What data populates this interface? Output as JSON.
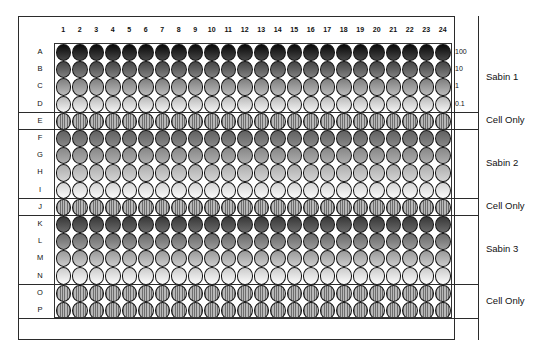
{
  "figure": {
    "caption": "",
    "column_headers": [
      "1",
      "2",
      "3",
      "4",
      "5",
      "6",
      "7",
      "8",
      "9",
      "10",
      "11",
      "12",
      "13",
      "14",
      "15",
      "16",
      "17",
      "18",
      "19",
      "20",
      "21",
      "22",
      "23",
      "24"
    ],
    "row_labels": [
      "A",
      "B",
      "C",
      "D",
      "E",
      "F",
      "G",
      "H",
      "I",
      "J",
      "K",
      "L",
      "M",
      "N",
      "O",
      "P"
    ],
    "concentration_labels": [
      "100",
      "10",
      "1",
      "0.1"
    ],
    "group_labels": [
      {
        "name": "sabin-1",
        "text": "Sabin 1"
      },
      {
        "name": "cell-only-1",
        "text": "Cell Only"
      },
      {
        "name": "sabin-2",
        "text": "Sabin 2"
      },
      {
        "name": "cell-only-2",
        "text": "Cell Only"
      },
      {
        "name": "sabin-3",
        "text": "Sabin 3"
      },
      {
        "name": "cell-only-3",
        "text": "Cell Only"
      }
    ]
  },
  "chart_data": {
    "type": "heatmap",
    "xlabel": "Column",
    "ylabel": "Row",
    "columns": 24,
    "rows": 16,
    "x": [
      "1",
      "2",
      "3",
      "4",
      "5",
      "6",
      "7",
      "8",
      "9",
      "10",
      "11",
      "12",
      "13",
      "14",
      "15",
      "16",
      "17",
      "18",
      "19",
      "20",
      "21",
      "22",
      "23",
      "24"
    ],
    "y": [
      "A",
      "B",
      "C",
      "D",
      "E",
      "F",
      "G",
      "H",
      "I",
      "J",
      "K",
      "L",
      "M",
      "N",
      "O",
      "P"
    ],
    "colormap": "grayscale",
    "value_scale": "0 = black (highest concentration signal), 100 = white (lowest)",
    "grid": false,
    "legend": "right",
    "row_groups": [
      {
        "group": "Sabin 1",
        "rows": [
          "A",
          "B",
          "C",
          "D"
        ],
        "concentrations": [
          "100",
          "10",
          "1",
          "0.1"
        ],
        "fill": "gradient",
        "shade_start": 4,
        "shade_end": 96
      },
      {
        "group": "Cell Only",
        "rows": [
          "E"
        ],
        "concentrations": [],
        "fill": "striped",
        "shade_start": 60,
        "shade_end": 60
      },
      {
        "group": "Sabin 2",
        "rows": [
          "F",
          "G",
          "H",
          "I"
        ],
        "concentrations": [],
        "fill": "gradient",
        "shade_start": 38,
        "shade_end": 98
      },
      {
        "group": "Cell Only",
        "rows": [
          "J"
        ],
        "concentrations": [],
        "fill": "striped",
        "shade_start": 60,
        "shade_end": 60
      },
      {
        "group": "Sabin 3",
        "rows": [
          "K",
          "L",
          "M",
          "N"
        ],
        "concentrations": [],
        "fill": "gradient",
        "shade_start": 22,
        "shade_end": 99
      },
      {
        "group": "Cell Only",
        "rows": [
          "O",
          "P"
        ],
        "concentrations": [],
        "fill": "striped",
        "shade_start": 60,
        "shade_end": 60
      }
    ],
    "series": [
      {
        "name": "A",
        "group": "Sabin 1",
        "concentration": "100",
        "values": [
          4,
          4,
          4,
          4,
          4,
          4,
          4,
          4,
          4,
          4,
          4,
          4,
          4,
          4,
          4,
          4,
          4,
          4,
          4,
          4,
          4,
          4,
          4,
          4
        ]
      },
      {
        "name": "B",
        "group": "Sabin 1",
        "concentration": "10",
        "values": [
          22,
          22,
          22,
          22,
          22,
          22,
          22,
          22,
          22,
          22,
          22,
          22,
          22,
          22,
          22,
          22,
          22,
          22,
          22,
          22,
          22,
          22,
          22,
          22
        ]
      },
      {
        "name": "C",
        "group": "Sabin 1",
        "concentration": "1",
        "values": [
          55,
          55,
          55,
          55,
          55,
          55,
          55,
          55,
          55,
          55,
          55,
          55,
          55,
          55,
          55,
          55,
          55,
          55,
          55,
          55,
          55,
          55,
          55,
          55
        ]
      },
      {
        "name": "D",
        "group": "Sabin 1",
        "concentration": "0.1",
        "values": [
          92,
          92,
          92,
          92,
          92,
          92,
          92,
          92,
          92,
          92,
          92,
          92,
          92,
          92,
          92,
          92,
          92,
          92,
          92,
          92,
          92,
          92,
          92,
          92
        ]
      },
      {
        "name": "E",
        "group": "Cell Only",
        "concentration": "",
        "values": [
          60,
          60,
          60,
          60,
          60,
          60,
          60,
          60,
          60,
          60,
          60,
          60,
          60,
          60,
          60,
          60,
          60,
          60,
          60,
          60,
          60,
          60,
          60,
          60
        ]
      },
      {
        "name": "F",
        "group": "Sabin 2",
        "concentration": "",
        "values": [
          38,
          38,
          38,
          38,
          38,
          38,
          38,
          38,
          38,
          38,
          38,
          38,
          38,
          38,
          38,
          38,
          38,
          38,
          38,
          38,
          38,
          38,
          38,
          38
        ]
      },
      {
        "name": "G",
        "group": "Sabin 2",
        "concentration": "",
        "values": [
          52,
          52,
          52,
          52,
          52,
          52,
          52,
          52,
          52,
          52,
          52,
          52,
          52,
          52,
          52,
          52,
          52,
          52,
          52,
          52,
          52,
          52,
          52,
          52
        ]
      },
      {
        "name": "H",
        "group": "Sabin 2",
        "concentration": "",
        "values": [
          70,
          70,
          70,
          70,
          70,
          70,
          70,
          70,
          70,
          70,
          70,
          70,
          70,
          70,
          70,
          70,
          70,
          70,
          70,
          70,
          70,
          70,
          70,
          70
        ]
      },
      {
        "name": "I",
        "group": "Sabin 2",
        "concentration": "",
        "values": [
          96,
          96,
          96,
          96,
          96,
          96,
          96,
          96,
          96,
          96,
          96,
          96,
          96,
          96,
          96,
          96,
          96,
          96,
          96,
          96,
          96,
          96,
          96,
          96
        ]
      },
      {
        "name": "J",
        "group": "Cell Only",
        "concentration": "",
        "values": [
          60,
          60,
          60,
          60,
          60,
          60,
          60,
          60,
          60,
          60,
          60,
          60,
          60,
          60,
          60,
          60,
          60,
          60,
          60,
          60,
          60,
          60,
          60,
          60
        ]
      },
      {
        "name": "K",
        "group": "Sabin 3",
        "concentration": "",
        "values": [
          24,
          24,
          24,
          24,
          24,
          24,
          24,
          24,
          24,
          24,
          24,
          24,
          24,
          24,
          24,
          24,
          24,
          24,
          24,
          24,
          24,
          24,
          24,
          24
        ]
      },
      {
        "name": "L",
        "group": "Sabin 3",
        "concentration": "",
        "values": [
          45,
          45,
          45,
          45,
          45,
          45,
          45,
          45,
          45,
          45,
          45,
          45,
          45,
          45,
          45,
          45,
          45,
          45,
          45,
          45,
          45,
          45,
          45,
          45
        ]
      },
      {
        "name": "M",
        "group": "Sabin 3",
        "concentration": "",
        "values": [
          68,
          68,
          68,
          68,
          68,
          68,
          68,
          68,
          68,
          68,
          68,
          68,
          68,
          68,
          68,
          68,
          68,
          68,
          68,
          68,
          68,
          68,
          68,
          68
        ]
      },
      {
        "name": "N",
        "group": "Sabin 3",
        "concentration": "",
        "values": [
          99,
          99,
          99,
          99,
          99,
          99,
          99,
          99,
          99,
          99,
          99,
          99,
          99,
          99,
          99,
          99,
          99,
          99,
          99,
          99,
          99,
          99,
          99,
          99
        ]
      },
      {
        "name": "O",
        "group": "Cell Only",
        "concentration": "",
        "values": [
          60,
          60,
          60,
          60,
          60,
          60,
          60,
          60,
          60,
          60,
          60,
          60,
          60,
          60,
          60,
          60,
          60,
          60,
          60,
          60,
          60,
          60,
          60,
          60
        ]
      },
      {
        "name": "P",
        "group": "Cell Only",
        "concentration": "",
        "values": [
          60,
          60,
          60,
          60,
          60,
          60,
          60,
          60,
          60,
          60,
          60,
          60,
          60,
          60,
          60,
          60,
          60,
          60,
          60,
          60,
          60,
          60,
          60,
          60
        ]
      }
    ]
  },
  "colors": {
    "border": "#2b2b2b",
    "well_outline": "#161616",
    "striped_dark": "#6e6e6e",
    "striped_light": "#b8b8b8",
    "text": "#111111",
    "background": "#ffffff"
  }
}
